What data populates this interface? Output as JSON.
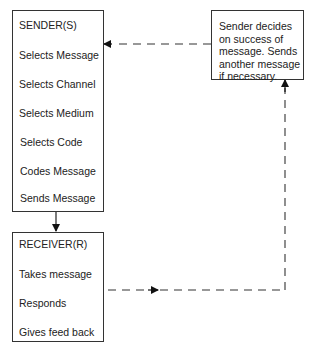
{
  "sender": {
    "title": "SENDER(S)",
    "steps": [
      "Selects Message",
      "Selects Channel",
      "Selects Medium",
      "Selects Code",
      "Codes Message",
      "Sends Message"
    ]
  },
  "receiver": {
    "title": "RECEIVER(R)",
    "steps": [
      "Takes message",
      "Responds",
      "Gives feed back"
    ]
  },
  "feedback": {
    "lines": [
      "Sender decides",
      "on success of",
      "message. Sends",
      "another message",
      "if necessary."
    ]
  },
  "colors": {
    "line": "#222222",
    "dash": "#444444",
    "background": "#ffffff"
  }
}
